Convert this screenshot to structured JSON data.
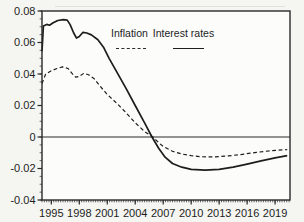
{
  "figure": {
    "background": "#f5f5f2",
    "plot_background": "#fcfcfb",
    "line_color": "#1d1d1d",
    "axis_color": "#2a2a2a",
    "legend": {
      "items": [
        {
          "label": "Inflation",
          "line_style": "dashed"
        },
        {
          "label": "Interest rates",
          "line_style": "solid"
        }
      ]
    }
  },
  "chart_data": {
    "type": "line",
    "title": "",
    "xlabel": "",
    "ylabel": "",
    "grid": false,
    "legend_position": "top-center-inside",
    "xlim": [
      1994.0,
      2020.6
    ],
    "ylim": [
      -0.04,
      0.08
    ],
    "x_ticks": [
      1995,
      1998,
      2001,
      2004,
      2007,
      2010,
      2013,
      2016,
      2019
    ],
    "x_minor_step": 0.25,
    "y_ticks": [
      {
        "v": 0.08,
        "label": "0.08"
      },
      {
        "v": 0.06,
        "label": "0.06"
      },
      {
        "v": 0.04,
        "label": "0.04"
      },
      {
        "v": 0.02,
        "label": "0.02"
      },
      {
        "v": 0.0,
        "label": "0"
      },
      {
        "v": -0.02,
        "label": "-0.02"
      },
      {
        "v": -0.04,
        "label": "-0.04"
      }
    ],
    "y_minor_step": 0.005,
    "zero_line": 0,
    "series": [
      {
        "name": "Inflation",
        "style": "dashed",
        "points": [
          [
            1994.0,
            0.034
          ],
          [
            1994.4,
            0.04
          ],
          [
            1995.0,
            0.042
          ],
          [
            1995.6,
            0.0435
          ],
          [
            1996.2,
            0.0445
          ],
          [
            1996.8,
            0.0435
          ],
          [
            1997.2,
            0.0405
          ],
          [
            1997.6,
            0.038
          ],
          [
            1998.0,
            0.0385
          ],
          [
            1998.5,
            0.0405
          ],
          [
            1999.0,
            0.0395
          ],
          [
            1999.6,
            0.037
          ],
          [
            2000.2,
            0.0325
          ],
          [
            2001.0,
            0.027
          ],
          [
            2002.0,
            0.0215
          ],
          [
            2003.0,
            0.0155
          ],
          [
            2004.0,
            0.009
          ],
          [
            2005.0,
            0.0035
          ],
          [
            2005.9,
            0.0
          ],
          [
            2006.5,
            -0.0035
          ],
          [
            2007.0,
            -0.006
          ],
          [
            2008.0,
            -0.009
          ],
          [
            2009.0,
            -0.0108
          ],
          [
            2010.0,
            -0.0118
          ],
          [
            2011.0,
            -0.0125
          ],
          [
            2012.5,
            -0.0127
          ],
          [
            2014.0,
            -0.012
          ],
          [
            2015.5,
            -0.011
          ],
          [
            2017.0,
            -0.0098
          ],
          [
            2018.5,
            -0.0087
          ],
          [
            2020.3,
            -0.008
          ]
        ]
      },
      {
        "name": "Interest rates",
        "style": "solid",
        "points": [
          [
            1994.0,
            0.0545
          ],
          [
            1994.15,
            0.0705
          ],
          [
            1994.5,
            0.0715
          ],
          [
            1994.8,
            0.071
          ],
          [
            1995.2,
            0.0725
          ],
          [
            1995.7,
            0.074
          ],
          [
            1996.3,
            0.0745
          ],
          [
            1996.7,
            0.0742
          ],
          [
            1997.0,
            0.0715
          ],
          [
            1997.4,
            0.066
          ],
          [
            1997.7,
            0.0628
          ],
          [
            1998.0,
            0.0638
          ],
          [
            1998.4,
            0.0665
          ],
          [
            1998.8,
            0.066
          ],
          [
            1999.3,
            0.0648
          ],
          [
            2000.0,
            0.0618
          ],
          [
            2000.6,
            0.057
          ],
          [
            2001.2,
            0.05
          ],
          [
            2002.0,
            0.0415
          ],
          [
            2003.0,
            0.031
          ],
          [
            2004.0,
            0.02
          ],
          [
            2005.0,
            0.009
          ],
          [
            2005.8,
            0.0
          ],
          [
            2006.5,
            -0.007
          ],
          [
            2007.2,
            -0.0128
          ],
          [
            2008.0,
            -0.0168
          ],
          [
            2009.0,
            -0.0192
          ],
          [
            2010.0,
            -0.0205
          ],
          [
            2011.5,
            -0.021
          ],
          [
            2013.0,
            -0.0205
          ],
          [
            2014.5,
            -0.0192
          ],
          [
            2016.0,
            -0.0172
          ],
          [
            2017.5,
            -0.0152
          ],
          [
            2019.0,
            -0.0132
          ],
          [
            2020.3,
            -0.0118
          ]
        ]
      }
    ]
  }
}
